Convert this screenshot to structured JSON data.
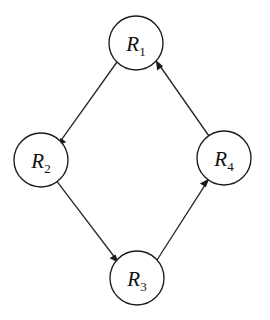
{
  "figure": {
    "name": "directed-cycle-graph",
    "background_color": "#ffffff",
    "stroke_color": "#1b1b1b",
    "label_color": "#111111"
  },
  "nodes": [
    {
      "id": "R1",
      "base": "R",
      "subscript": "1",
      "cx": 136,
      "cy": 43,
      "r": 27
    },
    {
      "id": "R2",
      "base": "R",
      "subscript": "2",
      "cx": 41,
      "cy": 160,
      "r": 27
    },
    {
      "id": "R3",
      "base": "R",
      "subscript": "3",
      "cx": 137,
      "cy": 278,
      "r": 27
    },
    {
      "id": "R4",
      "base": "R",
      "subscript": "4",
      "cx": 224,
      "cy": 158,
      "r": 27
    }
  ],
  "edges": [
    {
      "id": "e1",
      "from": "R1",
      "to": "R2",
      "direction": "down-left",
      "arrow_at": "R2"
    },
    {
      "id": "e2",
      "from": "R2",
      "to": "R3",
      "direction": "down-right",
      "arrow_at": "R3"
    },
    {
      "id": "e3",
      "from": "R3",
      "to": "R4",
      "direction": "up-right",
      "arrow_at": "R4"
    },
    {
      "id": "e4",
      "from": "R4",
      "to": "R1",
      "direction": "up-left",
      "arrow_at": "R1"
    }
  ],
  "labels": {
    "r1": "R",
    "r1_sub": "1",
    "r2": "R",
    "r2_sub": "2",
    "r3": "R",
    "r3_sub": "3",
    "r4": "R",
    "r4_sub": "4"
  }
}
